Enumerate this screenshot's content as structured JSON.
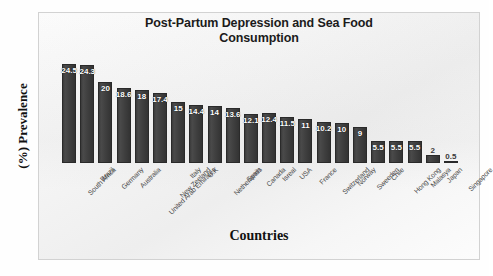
{
  "chart_data": {
    "type": "bar",
    "title": "Post-Partum Depression and Sea Food Consumption",
    "title_line1": "Post-Partum Depression and Sea Food",
    "title_line2": "Consumption",
    "xlabel": "Countries",
    "ylabel": "(%) Prevalence",
    "grid": false,
    "legend": "none",
    "ylim": [
      0,
      26
    ],
    "categories": [
      "South Africa",
      "Brazil",
      "Germany",
      "Australia",
      "United Arab Emirates",
      "New Zeeland",
      "Italy",
      "U.K",
      "Netherlands",
      "Spain",
      "Canada",
      "Isreal",
      "USA",
      "France",
      "Switzerland",
      "Norway",
      "Sweeden",
      "Chile",
      "Hong Kong",
      "Malasya",
      "Japan",
      "Singapore"
    ],
    "values": [
      24.5,
      24.3,
      20,
      18.6,
      18,
      17.4,
      15,
      14.4,
      14,
      13.6,
      12.1,
      12.4,
      11.5,
      11,
      10.2,
      10,
      9,
      5.5,
      5.5,
      5.5,
      2,
      0.5
    ],
    "value_labels": [
      "24.5",
      "24.3",
      "20",
      "18.6",
      "18",
      "17.4",
      "15",
      "14.4",
      "14",
      "13.6",
      "12.1",
      "12.4",
      "11.5",
      "11",
      "10.2",
      "10",
      "9",
      "5.5",
      "5.5",
      "5.5",
      "2",
      "0.5"
    ],
    "bar_color": "#3d3d3d",
    "label_color": "#ffffff",
    "background_color": "#f4f4f4",
    "frame_color": "#d2d2d2"
  }
}
